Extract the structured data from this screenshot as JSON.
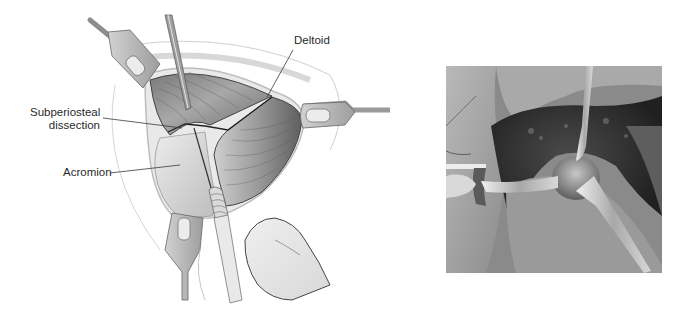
{
  "figure": {
    "illustration": {
      "labels": {
        "deltoid": "Deltoid",
        "subperiosteal_line1": "Subperiosteal",
        "subperiosteal_line2": "dissection",
        "acromion": "Acromion"
      },
      "structures": [
        "wound-opening",
        "deltoid-muscle",
        "acromion",
        "retractor-top-left",
        "retractor-right",
        "retractor-bottom",
        "elevator-instrument",
        "scalpel-handle",
        "hand"
      ]
    },
    "photo": {
      "description": "intraoperative grayscale photograph with retractors exposing acromion",
      "structures": [
        "retractor-left",
        "elevator-instrument",
        "exposed-bone",
        "surgical-drape"
      ]
    },
    "colors": {
      "background": "#ffffff",
      "label_text": "#2a2a2a",
      "leader_line": "#3a3a3a",
      "muscle_dark": "#6e6e6e",
      "muscle_light": "#c9c9c9",
      "bone": "#e4e4e4",
      "retractor": "#b5b5b5"
    }
  }
}
